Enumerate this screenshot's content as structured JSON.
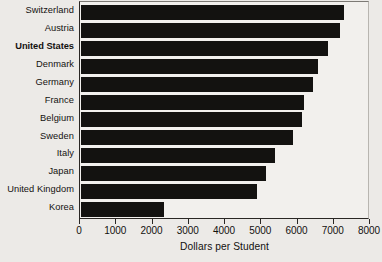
{
  "chart_data": {
    "type": "bar",
    "orientation": "horizontal",
    "title": "",
    "xlabel": "Dollars per Student",
    "ylabel": "",
    "xlim": [
      0,
      8000
    ],
    "xticks": [
      0,
      1000,
      2000,
      3000,
      4000,
      5000,
      6000,
      7000,
      8000
    ],
    "xtick_labels": [
      "0",
      "1000",
      "2000",
      "3000",
      "4000",
      "5000",
      "6000",
      "7000",
      "8000"
    ],
    "grid": false,
    "legend": null,
    "categories": [
      "Switzerland",
      "Austria",
      "United States",
      "Denmark",
      "Germany",
      "France",
      "Belgium",
      "Sweden",
      "Italy",
      "Japan",
      "United Kingdom",
      "Korea"
    ],
    "values": [
      7250,
      7150,
      6800,
      6550,
      6400,
      6150,
      6100,
      5850,
      5350,
      5100,
      4850,
      2300
    ],
    "highlighted_category": "United States",
    "bar_color": "#131210",
    "plot_background": "#f2f0ed",
    "figure_background": "#eceae7"
  }
}
